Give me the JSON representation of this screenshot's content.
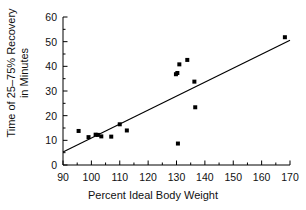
{
  "chart_data": {
    "type": "scatter",
    "title": "",
    "xlabel": "Percent Ideal Body Weight",
    "ylabel_line1": "Time of 25–75% Recovery",
    "ylabel_line2": "in Minutes",
    "xlim": [
      90,
      170
    ],
    "ylim": [
      0,
      60
    ],
    "xticks": [
      90,
      100,
      110,
      120,
      130,
      140,
      150,
      160,
      170
    ],
    "xminor_ticks": [
      95,
      105,
      115,
      125,
      135,
      145,
      155,
      165
    ],
    "yticks": [
      0,
      10,
      20,
      30,
      40,
      50,
      60
    ],
    "yminor_ticks": [
      5,
      15,
      25,
      35,
      45,
      55
    ],
    "xticklabels": [
      "90",
      "100",
      "110",
      "120",
      "130",
      "140",
      "150",
      "160",
      "170"
    ],
    "yticklabels": [
      "0",
      "10",
      "20",
      "30",
      "40",
      "50",
      "60"
    ],
    "grid": false,
    "legend": null,
    "marker": "square",
    "marker_color": "#000000",
    "marker_size": 4,
    "line_color": "#000000",
    "points": [
      {
        "x": 95.5,
        "y": 13.8
      },
      {
        "x": 99.0,
        "y": 11.3
      },
      {
        "x": 101.5,
        "y": 12.3
      },
      {
        "x": 102.3,
        "y": 12.2
      },
      {
        "x": 103.5,
        "y": 11.6
      },
      {
        "x": 107.0,
        "y": 11.5
      },
      {
        "x": 110.0,
        "y": 16.5
      },
      {
        "x": 112.5,
        "y": 14.0
      },
      {
        "x": 129.8,
        "y": 36.8
      },
      {
        "x": 130.3,
        "y": 37.3
      },
      {
        "x": 130.5,
        "y": 8.7
      },
      {
        "x": 131.0,
        "y": 40.8
      },
      {
        "x": 133.8,
        "y": 42.6
      },
      {
        "x": 136.3,
        "y": 33.8
      },
      {
        "x": 136.6,
        "y": 23.4
      },
      {
        "x": 168.2,
        "y": 51.8
      }
    ],
    "fit_line": {
      "x_start": 90,
      "y_start": 5.3,
      "x_end": 170,
      "y_end": 50.6
    }
  }
}
